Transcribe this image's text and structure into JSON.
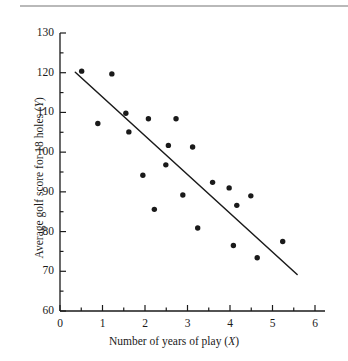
{
  "figure": {
    "top_rule_color": "#b9b9b9",
    "background": "#ffffff",
    "ink_color": "#1a1a1a"
  },
  "axes": {
    "x_title_prefix": "Number of years of play (",
    "x_title_var": "X",
    "x_title_suffix": ")",
    "y_title_prefix": "Average golf score for 18 holes (",
    "y_title_var": "Y",
    "y_title_suffix": ")",
    "x_ticks": [
      "0",
      "1",
      "2",
      "3",
      "4",
      "5",
      "6"
    ],
    "y_ticks": [
      "60",
      "70",
      "80",
      "90",
      "100",
      "110",
      "120",
      "130"
    ]
  },
  "chart_data": {
    "type": "scatter",
    "title": "",
    "xlabel": "Number of years of play (X)",
    "ylabel": "Average golf score for 18 holes (Y)",
    "xlim": [
      0,
      6
    ],
    "ylim": [
      60,
      130
    ],
    "x_major_step": 1,
    "x_minor_step": 0.5,
    "y_major_step": 10,
    "y_minor_step": 5,
    "grid": false,
    "legend": null,
    "marker": {
      "shape": "circle",
      "color": "#1a1a1a",
      "size_px": 5.4
    },
    "points": [
      {
        "x": 0.51,
        "y": 120.4
      },
      {
        "x": 0.89,
        "y": 107.2
      },
      {
        "x": 1.22,
        "y": 119.7
      },
      {
        "x": 1.55,
        "y": 109.8
      },
      {
        "x": 1.62,
        "y": 105.1
      },
      {
        "x": 1.95,
        "y": 94.2
      },
      {
        "x": 2.08,
        "y": 108.4
      },
      {
        "x": 2.22,
        "y": 85.6
      },
      {
        "x": 2.49,
        "y": 96.8
      },
      {
        "x": 2.55,
        "y": 101.7
      },
      {
        "x": 2.73,
        "y": 108.4
      },
      {
        "x": 2.89,
        "y": 89.2
      },
      {
        "x": 3.12,
        "y": 101.3
      },
      {
        "x": 3.24,
        "y": 80.9
      },
      {
        "x": 3.59,
        "y": 92.4
      },
      {
        "x": 3.98,
        "y": 91.0
      },
      {
        "x": 4.08,
        "y": 76.5
      },
      {
        "x": 4.16,
        "y": 86.6
      },
      {
        "x": 4.49,
        "y": 89.0
      },
      {
        "x": 4.64,
        "y": 73.4
      },
      {
        "x": 5.24,
        "y": 77.5
      }
    ],
    "trend_line": {
      "type": "linear-fit",
      "color": "#1a1a1a",
      "x_start": 0.36,
      "y_start": 120.1,
      "x_end": 5.58,
      "y_end": 69.2
    }
  }
}
